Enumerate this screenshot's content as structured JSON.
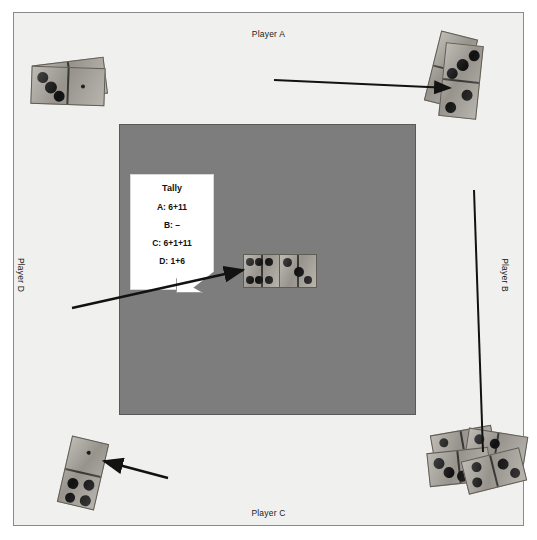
{
  "figure": {
    "board_color": "#7d7d7d",
    "frame_color": "#f0f0ee",
    "border_color": "#8a8a8a"
  },
  "players": {
    "top": "Player A",
    "right": "Player B",
    "bottom": "Player C",
    "left": "Player D"
  },
  "tally": {
    "title": "Tally",
    "lines": [
      "A: 6+11",
      "B: –",
      "C: 6+1+11",
      "D: 1+6"
    ]
  },
  "center_play": {
    "left_tile": "6|6",
    "right_tile": "3|0"
  },
  "hands": {
    "player_a": "domino-stack-top-left",
    "player_b": "domino-stack-top-right",
    "player_c": "domino-stack-bottom-right",
    "player_d": "domino-single-bottom-left"
  },
  "annotations": {
    "arrow_top": "arrow-to-player-b-hand",
    "arrow_tally": "arrow-tally-to-center-play",
    "arrow_bottom": "arrow-to-player-d-tile",
    "line_right": "line-to-player-c-hand"
  }
}
